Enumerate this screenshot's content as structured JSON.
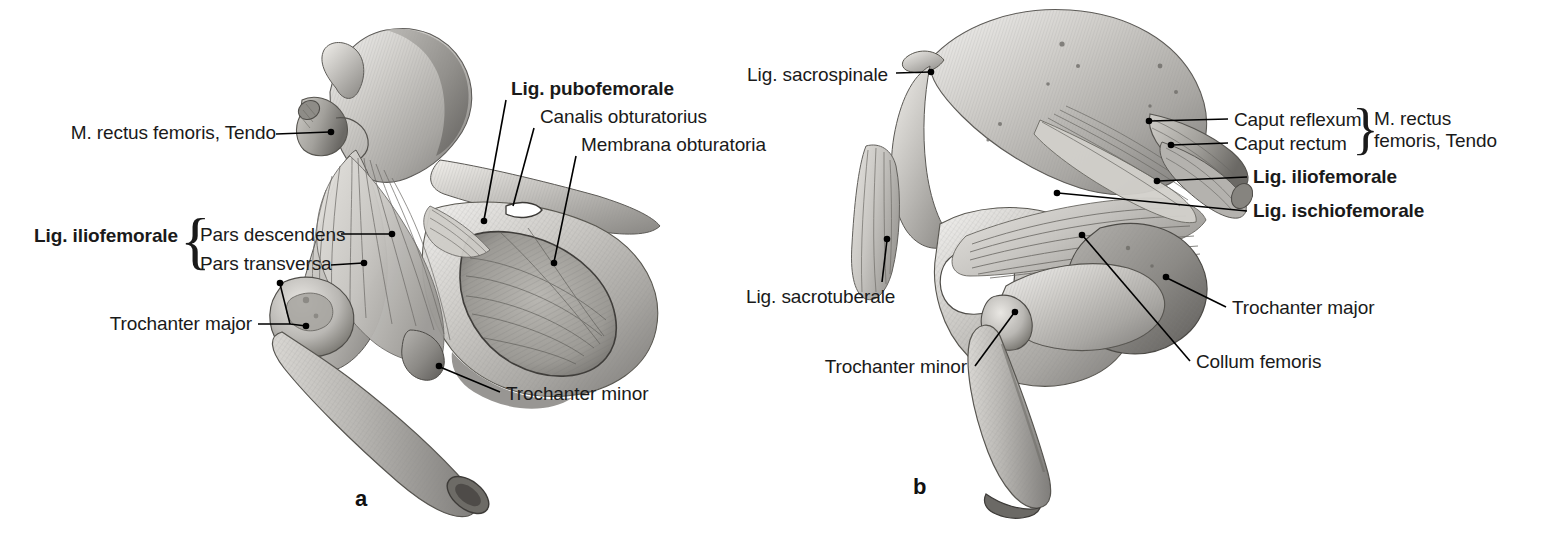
{
  "figure": {
    "background": "#ffffff",
    "ink": "#1a1a1a"
  },
  "panels": [
    {
      "id": "a",
      "letter": "a",
      "view": "anterior view of right hip joint with pelvis and femur",
      "letter_pos": {
        "x": 355,
        "y": 486
      }
    },
    {
      "id": "b",
      "letter": "b",
      "view": "posterior view of right hip joint with pelvis and femur",
      "letter_pos": {
        "x": 913,
        "y": 474
      }
    }
  ],
  "labels_a": [
    {
      "id": "m-rectus-femoris-tendo-a",
      "text": "M. rectus femoris, Tendo",
      "bold": false,
      "align": "right",
      "x": 266,
      "y": 130,
      "leader": {
        "from": [
          276,
          138
        ],
        "to": [
          336,
          133
        ],
        "dot": true
      }
    },
    {
      "id": "lig-pubofemorale",
      "text": "Lig. pubofemorale",
      "bold": true,
      "align": "left",
      "x": 511,
      "y": 85,
      "leader": {
        "from": [
          506,
          104
        ],
        "to": [
          484,
          222
        ],
        "dot": true
      }
    },
    {
      "id": "canalis-obturatorius",
      "text": "Canalis obturatorius",
      "bold": false,
      "align": "left",
      "x": 540,
      "y": 112,
      "leader": {
        "from": [
          535,
          131
        ],
        "to": [
          513,
          208
        ],
        "dot": false
      }
    },
    {
      "id": "membrana-obturatoria",
      "text": "Membrana obturatoria",
      "bold": false,
      "align": "left",
      "x": 581,
      "y": 140,
      "leader": {
        "from": [
          576,
          159
        ],
        "to": [
          554,
          262
        ],
        "dot": true
      }
    },
    {
      "id": "lig-iliofemorale-a",
      "text": "Lig. iliofemorale",
      "bold": true,
      "align": "right",
      "x": 178,
      "y": 226
    },
    {
      "id": "pars-descendens",
      "text": "Pars descendens",
      "bold": false,
      "align": "left",
      "x": 199,
      "y": 226,
      "leader": {
        "from": [
          339,
          236
        ],
        "to": [
          392,
          236
        ],
        "dot": true
      }
    },
    {
      "id": "pars-transversa",
      "text": "Pars transversa",
      "bold": false,
      "align": "left",
      "x": 199,
      "y": 255,
      "leader": {
        "from": [
          330,
          266
        ],
        "to": [
          364,
          264
        ],
        "dot": true
      }
    },
    {
      "id": "trochanter-major-a",
      "text": "Trochanter major",
      "bold": false,
      "align": "right",
      "x": 251,
      "y": 313,
      "leader_fork": {
        "trunk": [
          [
            258,
            323
          ],
          [
            288,
            323
          ]
        ],
        "branches": [
          [
            [
              288,
              323
            ],
            [
              305,
              325
            ]
          ],
          [
            [
              288,
              323
            ],
            [
              281,
              283
            ]
          ]
        ],
        "dots": [
          [
            305,
            325
          ],
          [
            281,
            283
          ]
        ]
      }
    },
    {
      "id": "trochanter-minor-a",
      "text": "Trochanter minor",
      "bold": false,
      "align": "left",
      "x": 506,
      "y": 385,
      "leader": {
        "from": [
          500,
          394
        ],
        "to": [
          437,
          366
        ],
        "dot": true
      }
    }
  ],
  "labels_b": [
    {
      "id": "lig-sacrospinale",
      "text": "Lig. sacrospinale",
      "bold": false,
      "align": "right",
      "x": 888,
      "y": 65,
      "leader": {
        "from": [
          896,
          75
        ],
        "to": [
          934,
          73
        ],
        "dot": true
      }
    },
    {
      "id": "caput-reflexum",
      "text": "Caput reflexum",
      "bold": false,
      "align": "left",
      "x": 1234,
      "y": 110,
      "leader": {
        "from": [
          1228,
          120
        ],
        "to": [
          1146,
          122
        ],
        "dot": true
      }
    },
    {
      "id": "caput-rectum",
      "text": "Caput rectum",
      "bold": false,
      "align": "left",
      "x": 1234,
      "y": 134,
      "leader": {
        "from": [
          1228,
          144
        ],
        "to": [
          1170,
          145
        ],
        "dot": true
      }
    },
    {
      "id": "m-rectus-femoris-tendo-b",
      "text": "M. rectus\nfemoris, Tendo",
      "bold": false,
      "align": "left",
      "x": 1374,
      "y": 110
    },
    {
      "id": "lig-iliofemorale-b",
      "text": "Lig. iliofemorale",
      "bold": true,
      "align": "left",
      "x": 1253,
      "y": 168,
      "leader": {
        "from": [
          1247,
          179
        ],
        "to": [
          1156,
          182
        ],
        "dot": true
      }
    },
    {
      "id": "lig-ischiofemorale",
      "text": "Lig. ischiofemorale",
      "bold": true,
      "align": "left",
      "x": 1253,
      "y": 202,
      "leader": {
        "from": [
          1247,
          212
        ],
        "to": [
          1055,
          192
        ],
        "dot": true
      }
    },
    {
      "id": "lig-sacrotuberale",
      "text": "Lig. sacrotuberale",
      "bold": false,
      "align": "left",
      "x": 746,
      "y": 288,
      "leader": {
        "from": [
          882,
          283
        ],
        "to": [
          887,
          238
        ],
        "dot": true
      }
    },
    {
      "id": "trochanter-major-b",
      "text": "Trochanter major",
      "bold": false,
      "align": "left",
      "x": 1232,
      "y": 299,
      "leader": {
        "from": [
          1226,
          309
        ],
        "to": [
          1165,
          277
        ],
        "dot": true
      }
    },
    {
      "id": "trochanter-minor-b",
      "text": "Trochanter minor",
      "bold": false,
      "align": "right",
      "x": 967,
      "y": 358,
      "leader": {
        "from": [
          975,
          368
        ],
        "to": [
          1013,
          312
        ],
        "dot": true
      }
    },
    {
      "id": "collum-femoris",
      "text": "Collum femoris",
      "bold": false,
      "align": "left",
      "x": 1196,
      "y": 353,
      "leader": {
        "from": [
          1190,
          363
        ],
        "to": [
          1081,
          235
        ],
        "dot": true
      }
    }
  ],
  "braces": [
    {
      "id": "brace-iliofemorale-a",
      "glyph": "{",
      "x": 184,
      "y": 215,
      "size": 56
    },
    {
      "id": "brace-rectus-femoris-b",
      "glyph": "}",
      "x": 1355,
      "y": 104,
      "size": 48
    }
  ]
}
